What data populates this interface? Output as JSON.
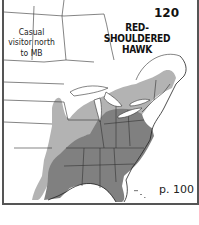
{
  "map": {
    "species_title": "RED-SHOULDERED HAWK",
    "species_number": "120",
    "range_note": "Casual visitor north to MB",
    "page_reference": "p. 100",
    "colors": {
      "year_round": "#808080",
      "summer": "#b3b3b3",
      "background": "#ffffff",
      "borders": "#333333"
    },
    "legend_regions": [
      {
        "name": "year-round range",
        "color": "#808080"
      },
      {
        "name": "summer range",
        "color": "#b3b3b3"
      }
    ]
  }
}
